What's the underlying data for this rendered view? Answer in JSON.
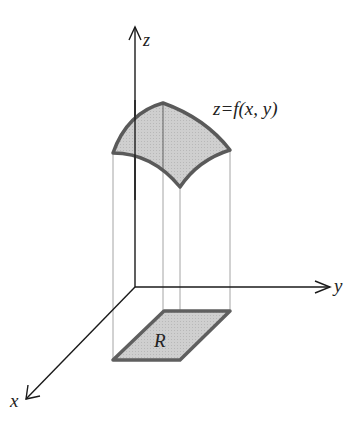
{
  "figure": {
    "labels": {
      "z_axis": "z",
      "y_axis": "y",
      "x_axis": "x",
      "surface": "z=f(x, y)",
      "region": "R"
    },
    "colors": {
      "axis": "#1a1a1a",
      "surface_fill": "#c8c8c8",
      "surface_edge": "#5a5a5a",
      "projection_lines": "#9a9a9a",
      "background": "#ffffff"
    }
  }
}
